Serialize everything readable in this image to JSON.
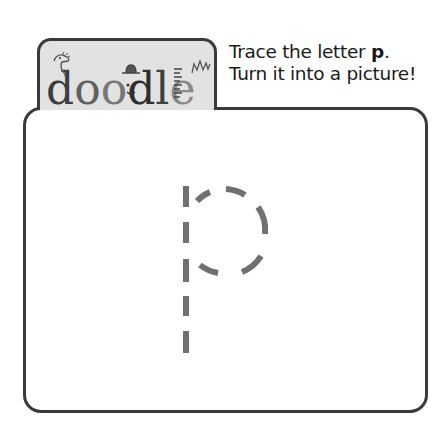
{
  "logo": {
    "letters": [
      "d",
      "o",
      "o",
      "d",
      "l",
      "e"
    ],
    "decorations": [
      "dinosaur",
      "face-with-hat",
      "ruler-lines",
      "crown-spikes"
    ]
  },
  "instructions": {
    "line1_prefix": "Trace the letter ",
    "line1_letter": "p",
    "line1_suffix": ".",
    "line2": "Turn it into a picture!"
  },
  "canvas": {
    "trace_letter": "p",
    "stroke_color": "#707070",
    "frame_color": "#3a3a3a",
    "tab_color": "#e2e2e2"
  }
}
